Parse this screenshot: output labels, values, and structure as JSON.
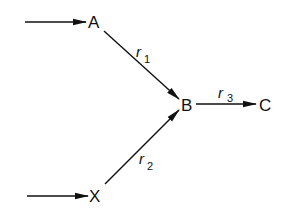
{
  "diagram": {
    "nodes": {
      "A": "A",
      "B": "B",
      "C": "C",
      "X": "X"
    },
    "edges": {
      "r1": {
        "symbol": "r",
        "subscript": "1",
        "from": "A",
        "to": "B"
      },
      "r2": {
        "symbol": "r",
        "subscript": "2",
        "from": "X",
        "to": "B"
      },
      "r3": {
        "symbol": "r",
        "subscript": "3",
        "from": "B",
        "to": "C"
      }
    },
    "colors": {
      "ink": "#111111",
      "background": "#ffffff"
    }
  }
}
